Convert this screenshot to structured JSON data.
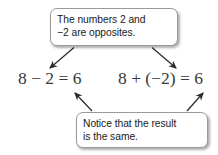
{
  "figure": {
    "background_color": "#ffffff",
    "callout_border_color": "#9a9a9a",
    "callout_text_color": "#1b1b1b",
    "equation_text_color": "#3a3a3a",
    "arrow_color": "#2b2b2b"
  },
  "callouts": {
    "top": {
      "line1": "The numbers 2 and",
      "line2": "−2 are opposites."
    },
    "bottom": {
      "line1": "Notice that the result",
      "line2": "is the same."
    }
  },
  "equations": {
    "left": "8 − 2 = 6",
    "right": "8 + (−2) = 6"
  }
}
